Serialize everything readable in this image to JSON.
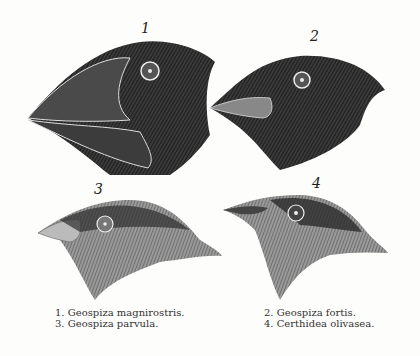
{
  "figure": {
    "numbers": [
      "1",
      "2",
      "3",
      "4"
    ],
    "captions": {
      "left": [
        "1.  Geospiza magnirostris.",
        "3.  Geospiza parvula."
      ],
      "right": [
        "2.  Geospiza fortis.",
        "4.  Certhidea olivasea."
      ]
    }
  }
}
